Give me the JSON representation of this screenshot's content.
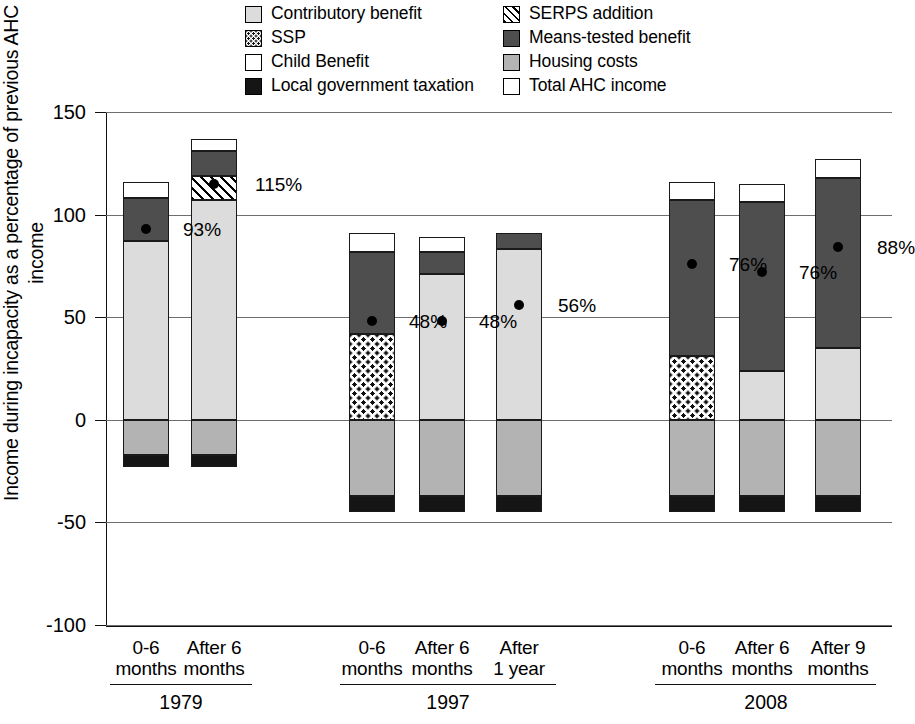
{
  "legend": {
    "columns": [
      [
        {
          "key": "contrib",
          "label": "Contributory benefit",
          "swatch": "contributory-benefit-swatch"
        },
        {
          "key": "ssp",
          "label": "SSP",
          "swatch": "ssp-swatch"
        },
        {
          "key": "child",
          "label": "Child Benefit",
          "swatch": "child-benefit-swatch"
        },
        {
          "key": "tax",
          "label": "Local government taxation",
          "swatch": "local-government-taxation-swatch"
        }
      ],
      [
        {
          "key": "serps",
          "label": "SERPS addition",
          "swatch": "serps-addition-swatch"
        },
        {
          "key": "means",
          "label": "Means-tested benefit",
          "swatch": "means-tested-benefit-swatch"
        },
        {
          "key": "housing",
          "label": "Housing costs",
          "swatch": "housing-costs-swatch"
        },
        {
          "key": "total",
          "label": "Total AHC income",
          "swatch": "total-ahc-income-marker"
        }
      ]
    ]
  },
  "chart_data": {
    "type": "bar",
    "subtype": "stacked-bar-with-point-overlay",
    "title": "",
    "xlabel": "",
    "ylabel": "Income during incapacity as a percentage of previous AHC income",
    "ylim": [
      -100,
      150
    ],
    "yticks": [
      -100,
      -50,
      0,
      50,
      100,
      150
    ],
    "ytick_labels": [
      "-100",
      "-50",
      "0",
      "50",
      "100",
      "150"
    ],
    "grid": "horizontal",
    "legend_position": "top",
    "series_keys": [
      "contrib",
      "ssp",
      "child",
      "tax",
      "serps",
      "means",
      "housing"
    ],
    "series_labels": {
      "contrib": "Contributory benefit",
      "ssp": "SSP",
      "child": "Child Benefit",
      "tax": "Local government taxation",
      "serps": "SERPS addition",
      "means": "Means-tested benefit",
      "housing": "Housing costs",
      "total": "Total AHC income"
    },
    "groups": [
      {
        "name": "1979",
        "categories": [
          "0-6\nmonths",
          "After 6\nmonths"
        ]
      },
      {
        "name": "1997",
        "categories": [
          "0-6\nmonths",
          "After 6\nmonths",
          "After\n1 year"
        ]
      },
      {
        "name": "2008",
        "categories": [
          "0-6\nmonths",
          "After 6\nmonths",
          "After 9\nmonths"
        ]
      }
    ],
    "bars": [
      {
        "group": "1979",
        "category": "0-6\nmonths",
        "segments": [
          {
            "key": "contrib",
            "from": 0,
            "to": 87
          },
          {
            "key": "means",
            "from": 87,
            "to": 108
          },
          {
            "key": "child",
            "from": 108,
            "to": 116
          },
          {
            "key": "housing",
            "from": 0,
            "to": -17
          },
          {
            "key": "tax",
            "from": -17,
            "to": -23
          }
        ],
        "total_ahc_income": 93,
        "label": "93%"
      },
      {
        "group": "1979",
        "category": "After 6\nmonths",
        "segments": [
          {
            "key": "contrib",
            "from": 0,
            "to": 107
          },
          {
            "key": "serps",
            "from": 107,
            "to": 119
          },
          {
            "key": "means",
            "from": 119,
            "to": 131
          },
          {
            "key": "child",
            "from": 131,
            "to": 137
          },
          {
            "key": "housing",
            "from": 0,
            "to": -17
          },
          {
            "key": "tax",
            "from": -17,
            "to": -23
          }
        ],
        "total_ahc_income": 115,
        "label": "115%"
      },
      {
        "group": "1997",
        "category": "0-6\nmonths",
        "segments": [
          {
            "key": "ssp",
            "from": 0,
            "to": 42
          },
          {
            "key": "means",
            "from": 42,
            "to": 82
          },
          {
            "key": "child",
            "from": 82,
            "to": 91
          },
          {
            "key": "housing",
            "from": 0,
            "to": -37
          },
          {
            "key": "tax",
            "from": -37,
            "to": -45
          }
        ],
        "total_ahc_income": 48,
        "label": "48%"
      },
      {
        "group": "1997",
        "category": "After 6\nmonths",
        "segments": [
          {
            "key": "contrib",
            "from": 0,
            "to": 71
          },
          {
            "key": "means",
            "from": 71,
            "to": 82
          },
          {
            "key": "child",
            "from": 82,
            "to": 89
          },
          {
            "key": "housing",
            "from": 0,
            "to": -37
          },
          {
            "key": "tax",
            "from": -37,
            "to": -45
          }
        ],
        "total_ahc_income": 48,
        "label": "48%"
      },
      {
        "group": "1997",
        "category": "After\n1 year",
        "segments": [
          {
            "key": "contrib",
            "from": 0,
            "to": 83
          },
          {
            "key": "means",
            "from": 83,
            "to": 91
          },
          {
            "key": "housing",
            "from": 0,
            "to": -37
          },
          {
            "key": "tax",
            "from": -37,
            "to": -45
          }
        ],
        "total_ahc_income": 56,
        "label": "56%"
      },
      {
        "group": "2008",
        "category": "0-6\nmonths",
        "segments": [
          {
            "key": "ssp",
            "from": 0,
            "to": 31
          },
          {
            "key": "means",
            "from": 31,
            "to": 107
          },
          {
            "key": "child",
            "from": 107,
            "to": 116
          },
          {
            "key": "housing",
            "from": 0,
            "to": -37
          },
          {
            "key": "tax",
            "from": -37,
            "to": -45
          }
        ],
        "total_ahc_income": 76,
        "label": "76%"
      },
      {
        "group": "2008",
        "category": "After 6\nmonths",
        "segments": [
          {
            "key": "contrib",
            "from": 0,
            "to": 24
          },
          {
            "key": "means",
            "from": 24,
            "to": 106
          },
          {
            "key": "child",
            "from": 106,
            "to": 115
          },
          {
            "key": "housing",
            "from": 0,
            "to": -37
          },
          {
            "key": "tax",
            "from": -37,
            "to": -45
          }
        ],
        "total_ahc_income": 72,
        "label": "76%"
      },
      {
        "group": "2008",
        "category": "After 9\nmonths",
        "segments": [
          {
            "key": "contrib",
            "from": 0,
            "to": 35
          },
          {
            "key": "means",
            "from": 35,
            "to": 118
          },
          {
            "key": "child",
            "from": 118,
            "to": 127
          },
          {
            "key": "housing",
            "from": 0,
            "to": -37
          },
          {
            "key": "tax",
            "from": -37,
            "to": -45
          }
        ],
        "total_ahc_income": 84,
        "label": "88%"
      }
    ]
  }
}
